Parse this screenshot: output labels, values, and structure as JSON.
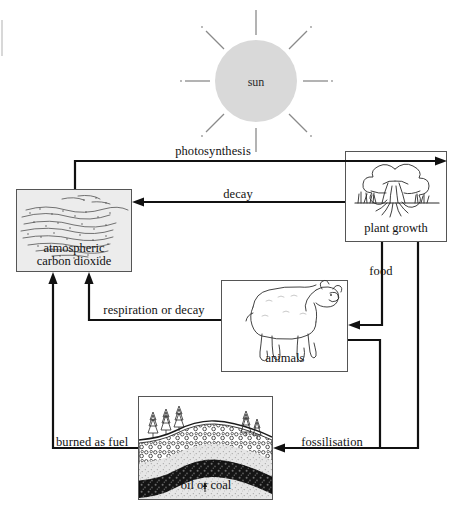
{
  "diagram": {
    "canvas": {
      "width": 455,
      "height": 522
    },
    "colors": {
      "line": "#1a1a1a",
      "box_stroke": "#4a4a4a",
      "sun_fill": "#d8d8d8",
      "ray": "#8a8a8a",
      "co2_fill": "#e9e9e9",
      "ground_fill": "#e4e4e4",
      "rock_fill": "#dcdcdc",
      "coal_fill": "#1d1d1d",
      "text": "#111111"
    },
    "nodes": [
      {
        "id": "sun",
        "label": "sun",
        "shape": "circle",
        "cx": 256,
        "cy": 81,
        "r": 41
      },
      {
        "id": "atmospheric-carbon-dioxide",
        "label_line1": "atmospheric",
        "label_line2": "carbon dioxide",
        "shape": "box",
        "x": 16,
        "y": 189,
        "w": 116,
        "h": 83
      },
      {
        "id": "plant-growth",
        "label": "plant growth",
        "shape": "box",
        "x": 345,
        "y": 151,
        "w": 102,
        "h": 91
      },
      {
        "id": "animals",
        "label": "animals",
        "shape": "box",
        "x": 221,
        "y": 280,
        "w": 127,
        "h": 92
      },
      {
        "id": "oil-or-coal",
        "label": "oil or coal",
        "shape": "box",
        "x": 138,
        "y": 396,
        "w": 135,
        "h": 104
      }
    ],
    "arrows": [
      {
        "id": "photosynthesis",
        "label": "photosynthesis",
        "from": "atmospheric-carbon-dioxide",
        "to": "plant-growth",
        "label_x": 213,
        "label_y": 145
      },
      {
        "id": "decay",
        "label": "decay",
        "from": "plant-growth",
        "to": "atmospheric-carbon-dioxide",
        "label_x": 238,
        "label_y": 188
      },
      {
        "id": "food",
        "label": "food",
        "from": "plant-growth",
        "to": "animals",
        "label_x": 381,
        "label_y": 265
      },
      {
        "id": "respiration-or-decay",
        "label": "respiration or decay",
        "from": "animals",
        "to": "atmospheric-carbon-dioxide",
        "label_x": 154,
        "label_y": 304
      },
      {
        "id": "fossilisation",
        "label": "fossilisation",
        "from": "animals-and-plants",
        "to": "oil-or-coal",
        "label_x": 332,
        "label_y": 436
      },
      {
        "id": "burned-as-fuel",
        "label": "burned as fuel",
        "from": "oil-or-coal",
        "to": "atmospheric-carbon-dioxide",
        "label_x": 56,
        "label_y": 436
      }
    ]
  }
}
